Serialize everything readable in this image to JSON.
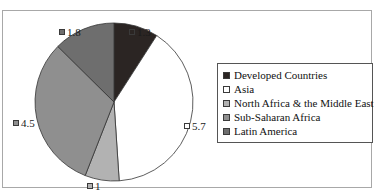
{
  "top_sliver_text": "",
  "chart_data": {
    "type": "pie",
    "title": "",
    "subtitle": "",
    "xlabel": "",
    "ylabel": "",
    "grid": false,
    "legend_position": "right",
    "total": 14.3,
    "start_angle_deg": 0,
    "direction": "clockwise",
    "categories": [
      "Developed Countries",
      "Asia",
      "North Africa & the Middle East",
      "Sub-Saharan Africa",
      "Latin America"
    ],
    "values": [
      1.3,
      5.7,
      1,
      4.5,
      1.8
    ],
    "value_labels": [
      "1.3",
      "5.7",
      "1",
      "4.5",
      "1.8"
    ],
    "colors": [
      "#2b2523",
      "#ffffff",
      "#b2b2b2",
      "#8f8f8f",
      "#6e6e6e"
    ],
    "slices": [
      {
        "label": "Developed Countries",
        "value": 1.3,
        "display": "1.3",
        "color": "#2b2523"
      },
      {
        "label": "Asia",
        "value": 5.7,
        "display": "5.7",
        "color": "#ffffff"
      },
      {
        "label": "North Africa & the Middle East",
        "value": 1,
        "display": "1",
        "color": "#b2b2b2"
      },
      {
        "label": "Sub-Saharan Africa",
        "value": 4.5,
        "display": "4.5",
        "color": "#8f8f8f"
      },
      {
        "label": "Latin America",
        "value": 1.8,
        "display": "1.8",
        "color": "#6e6e6e"
      }
    ]
  },
  "labels": {
    "developed": "1.3",
    "asia": "5.7",
    "north_africa": "1",
    "sub_saharan": "4.5",
    "latin_america": "1.8"
  },
  "legend": {
    "items": [
      {
        "label": "Developed Countries",
        "color": "#2b2523"
      },
      {
        "label": "Asia",
        "color": "#ffffff"
      },
      {
        "label": "North Africa & the Middle East",
        "color": "#b2b2b2"
      },
      {
        "label": "Sub-Saharan Africa",
        "color": "#8f8f8f"
      },
      {
        "label": "Latin America",
        "color": "#6e6e6e"
      }
    ]
  },
  "geometry": {
    "cx": 111,
    "cy": 91,
    "r": 79
  }
}
